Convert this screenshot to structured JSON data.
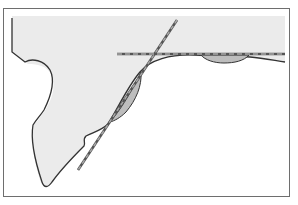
{
  "diagram": {
    "type": "geometry-tangent-lines",
    "caption_fragment": "",
    "colors": {
      "background": "#ffffff",
      "frame": "#6e6e6e",
      "region_fill": "#ebebeb",
      "outline": "#333333",
      "lens_fill": "#bdbdbd",
      "tangent_line": "#555555",
      "tangent_dash": "#a8a8a8"
    },
    "frame": {
      "x": 3,
      "y": 8,
      "width": 287,
      "height": 188
    },
    "elements": [
      {
        "name": "shaded-region",
        "description": "Grey region bounded by wavy left edge and smooth curve"
      },
      {
        "name": "diagonal-tangent-line",
        "from": [
          177,
          20
        ],
        "to": [
          78,
          170
        ],
        "style": "dashed"
      },
      {
        "name": "horizontal-tangent-line",
        "from": [
          117,
          54
        ],
        "to": [
          285,
          54
        ],
        "style": "dashed"
      },
      {
        "name": "lens-left",
        "description": "Shaded lens between curve and diagonal line"
      },
      {
        "name": "lens-right",
        "description": "Shaded lens between curve and horizontal line"
      }
    ]
  }
}
